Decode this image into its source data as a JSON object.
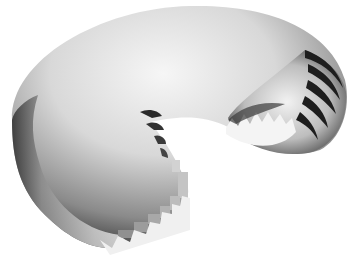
{
  "image": {
    "subject": "3D rendered torus segment with stepped scalloped cut edges",
    "background": "#ffffff",
    "palette": {
      "highlight": "#f4f4f4",
      "midtone": "#b8b8b8",
      "shadow": "#3a3a3a",
      "deep_shadow": "#1a1a1a"
    }
  }
}
